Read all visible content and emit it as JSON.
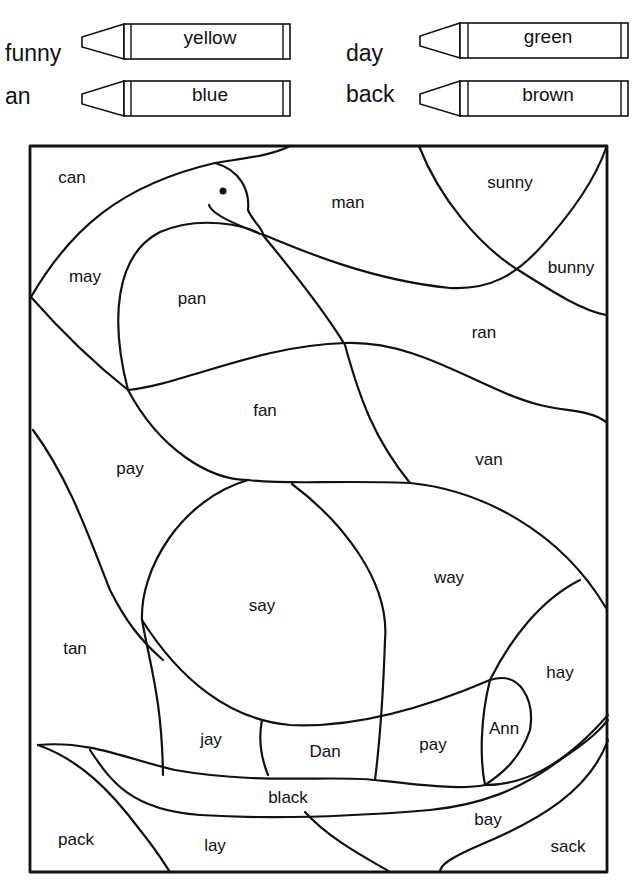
{
  "color_key": [
    {
      "word": "funny",
      "color_name": "yellow",
      "color": "#f2d21b"
    },
    {
      "word": "an",
      "color_name": "blue",
      "color": "#2a62c9"
    },
    {
      "word": "day",
      "color_name": "green",
      "color": "#2f9a3c"
    },
    {
      "word": "back",
      "color_name": "brown",
      "color": "#7a4a22"
    }
  ],
  "regions": [
    {
      "label": "can",
      "x": 72,
      "y": 178
    },
    {
      "label": "man",
      "x": 348,
      "y": 203
    },
    {
      "label": "sunny",
      "x": 510,
      "y": 183
    },
    {
      "label": "may",
      "x": 85,
      "y": 277
    },
    {
      "label": "pan",
      "x": 192,
      "y": 299
    },
    {
      "label": "bunny",
      "x": 571,
      "y": 268
    },
    {
      "label": "ran",
      "x": 484,
      "y": 333
    },
    {
      "label": "fan",
      "x": 265,
      "y": 411
    },
    {
      "label": "pay",
      "x": 130,
      "y": 469
    },
    {
      "label": "van",
      "x": 489,
      "y": 460
    },
    {
      "label": "way",
      "x": 449,
      "y": 578
    },
    {
      "label": "say",
      "x": 262,
      "y": 606
    },
    {
      "label": "tan",
      "x": 75,
      "y": 649
    },
    {
      "label": "hay",
      "x": 560,
      "y": 673
    },
    {
      "label": "Ann",
      "x": 504,
      "y": 729
    },
    {
      "label": "jay",
      "x": 211,
      "y": 740
    },
    {
      "label": "Dan",
      "x": 325,
      "y": 752
    },
    {
      "label": "pay",
      "x": 433,
      "y": 745
    },
    {
      "label": "black",
      "x": 288,
      "y": 798
    },
    {
      "label": "bay",
      "x": 488,
      "y": 820
    },
    {
      "label": "pack",
      "x": 76,
      "y": 840
    },
    {
      "label": "lay",
      "x": 215,
      "y": 846
    },
    {
      "label": "sack",
      "x": 568,
      "y": 847
    }
  ]
}
